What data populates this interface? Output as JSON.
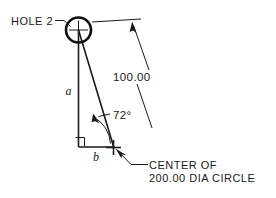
{
  "drawing": {
    "title": "Hole location triangle detail",
    "background_color": "#ffffff",
    "line_color": "#1a1a1a",
    "labels": {
      "hole": "HOLE 2",
      "linear_dimension": "100.00",
      "angle_dimension": "72°",
      "vertical_leg": "a",
      "horizontal_leg": "b",
      "note_line_1": "CENTER OF",
      "note_line_2": "200.00 DIA CIRCLE"
    }
  }
}
